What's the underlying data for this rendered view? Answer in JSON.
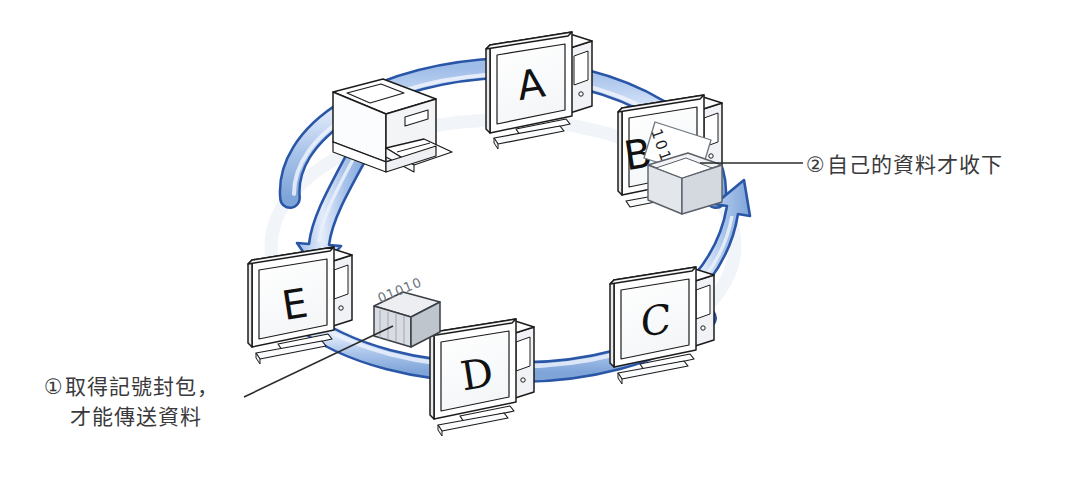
{
  "diagram": {
    "type": "network-topology-illustration",
    "background_color": "#ffffff",
    "ring": {
      "name": "token-ring-cable",
      "outline_color": "#2a56a8",
      "fill_color": "#b9cfee",
      "highlight_color": "#dfe9f8",
      "shadow_color": "#e6ecf5"
    },
    "nodes": [
      {
        "id": "A",
        "label": "A",
        "kind": "computer-monitor",
        "x": 541,
        "y": 88
      },
      {
        "id": "B",
        "label": "B",
        "kind": "computer-monitor",
        "x": 670,
        "y": 152,
        "has_data_sheet": true,
        "data_sheet_text": "101000",
        "has_tray": true
      },
      {
        "id": "C",
        "label": "C",
        "kind": "computer-monitor",
        "x": 666,
        "y": 323
      },
      {
        "id": "D",
        "label": "D",
        "kind": "computer-monitor",
        "x": 487,
        "y": 378
      },
      {
        "id": "E",
        "label": "E",
        "kind": "computer-monitor",
        "x": 303,
        "y": 306
      },
      {
        "id": "printer",
        "label": "",
        "kind": "laser-printer",
        "x": 383,
        "y": 131
      }
    ],
    "token": {
      "name": "token-packet",
      "label_text": "01010",
      "x": 403,
      "y": 318
    },
    "arrows": [
      {
        "name": "arrow-printer-to-e",
        "direction": "down",
        "from": "printer",
        "to": "E"
      },
      {
        "name": "arrow-c-to-b",
        "direction": "up",
        "from": "C",
        "to": "B"
      }
    ]
  },
  "callouts": {
    "one": {
      "marker": "①",
      "line1": "取得記號封包，",
      "line2": "才能傳送資料",
      "leader": "diagonal line to token packet"
    },
    "two": {
      "marker": "②",
      "line1": "自己的資料才收下",
      "leader": "horizontal line to node B tray"
    }
  },
  "colors": {
    "ring_outline": "#2a56a8",
    "ring_fill": "#b9cfee",
    "line_art": "#1c1c1c",
    "text": "#3a3a3c"
  }
}
